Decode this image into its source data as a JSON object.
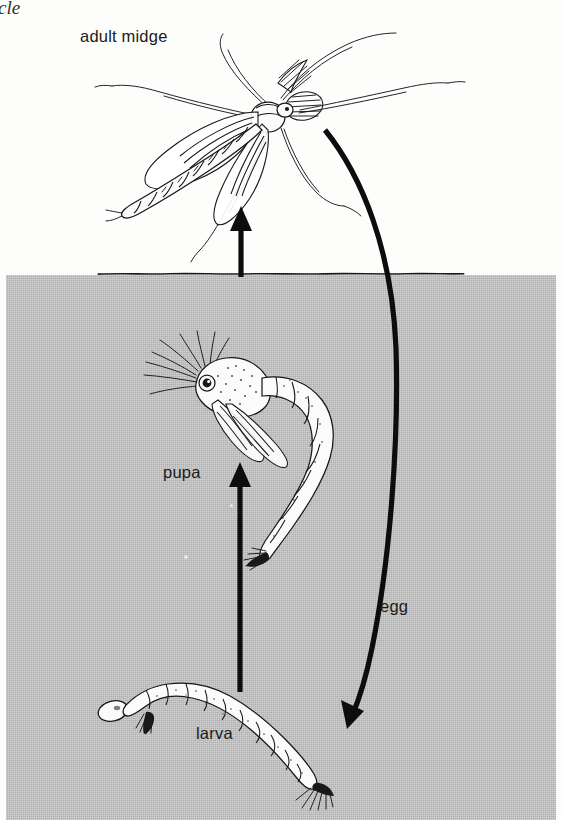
{
  "figure": {
    "kind": "life-cycle-diagram",
    "subject": "midge",
    "caption_fragment": "cle",
    "background_color": "#fdfdfc",
    "water_color": "#b9b9b9",
    "ink_color": "#16181a"
  },
  "labels": {
    "adult": "adult midge",
    "pupa": "pupa",
    "egg": "egg",
    "larva": "larva"
  },
  "stages": [
    {
      "name": "adult midge",
      "label": "adult midge",
      "medium": "air",
      "position": "top"
    },
    {
      "name": "pupa",
      "label": "pupa",
      "medium": "water",
      "position": "middle"
    },
    {
      "name": "larva",
      "label": "larva",
      "medium": "water",
      "position": "bottom"
    },
    {
      "name": "egg",
      "label": "egg",
      "medium": "water",
      "position": "right"
    }
  ],
  "arrows": [
    {
      "name": "pupa-to-adult",
      "shape": "straight",
      "direction": "up",
      "from": "pupa",
      "to": "adult midge"
    },
    {
      "name": "larva-to-pupa",
      "shape": "straight",
      "direction": "up",
      "from": "larva",
      "to": "pupa"
    },
    {
      "name": "adult-to-larva",
      "shape": "curved",
      "direction": "down-left",
      "from": "adult midge",
      "to": "larva",
      "label": "egg"
    }
  ],
  "regions": {
    "air_label": "air",
    "water_label": "water"
  }
}
